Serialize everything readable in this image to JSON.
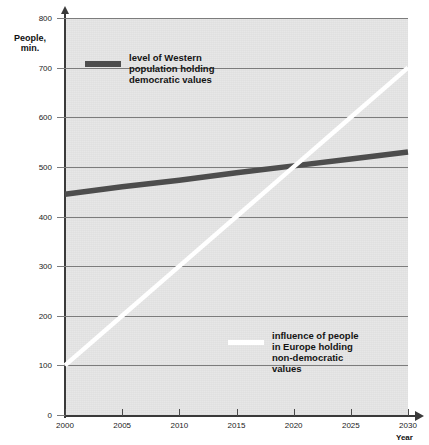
{
  "chart_data": {
    "type": "line",
    "title": "",
    "subtitle": "",
    "xlabel": "Year",
    "ylabel": "People, min.",
    "xlim": [
      2000,
      2030
    ],
    "ylim": [
      0,
      800
    ],
    "grid": true,
    "legend_position": "inside-plot",
    "x": [
      2000,
      2005,
      2010,
      2015,
      2020,
      2025,
      2030
    ],
    "xticklabels": [
      "2000",
      "2005",
      "2010",
      "2015",
      "2020",
      "2025",
      "2030"
    ],
    "yticks": [
      0,
      100,
      200,
      300,
      400,
      500,
      600,
      700,
      800
    ],
    "yticklabels": [
      "0",
      "100",
      "200",
      "300",
      "400",
      "500",
      "600",
      "700",
      "800"
    ],
    "series": [
      {
        "name": "level of Western population holding democratic values",
        "color": "#4d4d4d",
        "values": [
          445,
          460,
          473,
          488,
          502,
          516,
          530
        ]
      },
      {
        "name": "influence of people in Europe holding non-democratic values",
        "color": "#ffffff",
        "values": [
          100,
          200,
          300,
          400,
          500,
          600,
          700
        ]
      }
    ],
    "annotations": []
  },
  "axes": {
    "y_title": "People,\nmin.",
    "y_title_line1": "People,",
    "y_title_line2": "min.",
    "x_title": "Year"
  },
  "legend": {
    "democratic": {
      "label": "level of Western\npopulation holding\ndemocratic values",
      "swatch_color": "#4d4d4d"
    },
    "non_democratic": {
      "label": "influence of people\nin Europe holding\nnon-democratic\nvalues",
      "swatch_color": "#ffffff"
    }
  },
  "colors": {
    "plot_background": "#e7e7e7",
    "gridline": "#7c7c7c",
    "axis": "#3a3a3a",
    "text": "#141414"
  }
}
